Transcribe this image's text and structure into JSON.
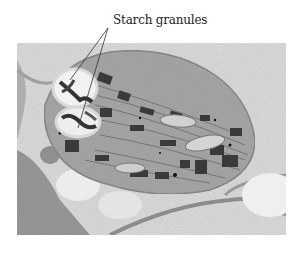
{
  "figure": {
    "labels": [
      {
        "text": "Starch granules",
        "targets": 2
      }
    ],
    "colors": {
      "background": "#ffffff",
      "cytoplasm": "#d8d8d8",
      "chloroplast_stroma": "#a9a9a9",
      "grana": "#3a3a3a",
      "starch": "#f0f0f0",
      "vacuole": "#e9e9e9"
    }
  }
}
